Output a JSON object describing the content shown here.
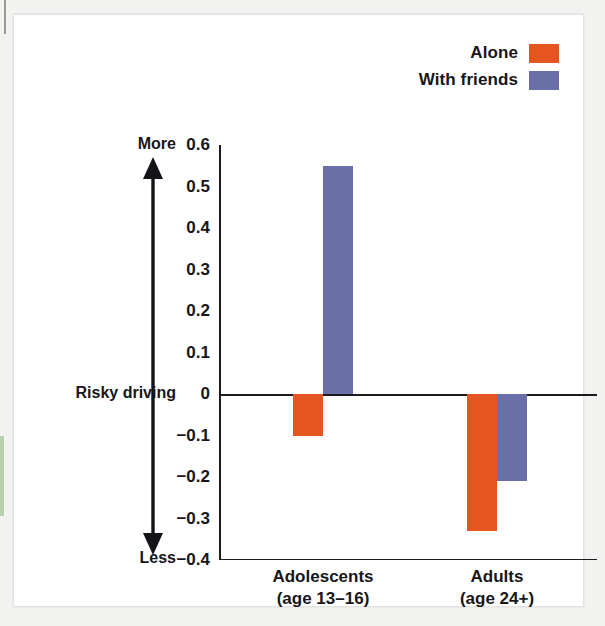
{
  "chart_data": {
    "type": "bar",
    "title": "",
    "subtitle": "",
    "xlabel": "",
    "ylabel": "Risky driving",
    "ylim": [
      -0.4,
      0.6
    ],
    "grid": false,
    "legend_position": "top-right",
    "categories": [
      "Adolescents",
      "Adults"
    ],
    "category_sublabels": [
      "(age 13–16)",
      "(age 24+)"
    ],
    "series": [
      {
        "name": "Alone",
        "color": "#e4551f",
        "values": [
          -0.1,
          -0.33
        ]
      },
      {
        "name": "With friends",
        "color": "#6b6fa8",
        "values": [
          0.55,
          -0.21
        ]
      }
    ],
    "yticks": [
      {
        "value": 0.6,
        "label": "0.6"
      },
      {
        "value": 0.5,
        "label": "0.5"
      },
      {
        "value": 0.4,
        "label": "0.4"
      },
      {
        "value": 0.3,
        "label": "0.3"
      },
      {
        "value": 0.2,
        "label": "0.2"
      },
      {
        "value": 0.1,
        "label": "0.1"
      },
      {
        "value": 0.0,
        "label": "0"
      },
      {
        "value": -0.1,
        "label": "−0.1"
      },
      {
        "value": -0.2,
        "label": "−0.2"
      },
      {
        "value": -0.3,
        "label": "−0.3"
      },
      {
        "value": -0.4,
        "label": "−0.4"
      }
    ],
    "annotations": {
      "axis_arrow_top_label": "More",
      "axis_arrow_bottom_label": "Less",
      "axis_middle_label": "Risky driving"
    }
  },
  "legend": {
    "items": [
      {
        "label": "Alone",
        "color": "#e4551f"
      },
      {
        "label": "With friends",
        "color": "#6b6fa8"
      }
    ]
  },
  "colors": {
    "alone": "#e4551f",
    "with_friends": "#6b6fa8",
    "axis": "#1b1a1e",
    "text": "#17161a",
    "page_background": "#ffffff",
    "frame_background": "#f2f2f0",
    "edge_accent": "#b9cfae"
  }
}
